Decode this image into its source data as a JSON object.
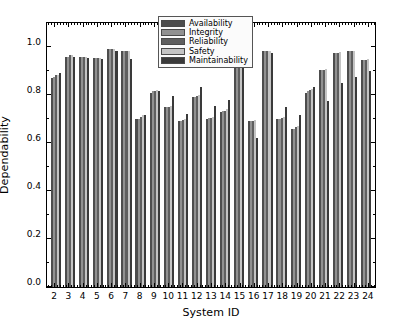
{
  "chart_data": {
    "type": "bar",
    "title": "",
    "subtitle": "",
    "xlabel": "System ID",
    "ylabel": "Dependability",
    "categories": [
      "2",
      "3",
      "4",
      "5",
      "6",
      "7",
      "8",
      "9",
      "10",
      "11",
      "12",
      "13",
      "14",
      "15",
      "16",
      "17",
      "18",
      "19",
      "20",
      "21",
      "22",
      "23",
      "24"
    ],
    "xlim": [
      1.5,
      24.5
    ],
    "ylim": [
      0.0,
      1.1
    ],
    "yticks": [
      "0.0",
      "0.2",
      "0.4",
      "0.6",
      "0.8",
      "1.0"
    ],
    "ytick_values": [
      0.0,
      0.2,
      0.4,
      0.6,
      0.8,
      1.0
    ],
    "grid": false,
    "legend_position": "upper center",
    "legend_entries": [
      "Availability",
      "Integrity",
      "Reliability",
      "Safety",
      "Maintainability"
    ],
    "series": [
      {
        "name": "Availability",
        "color": "#4d4d4d",
        "values": [
          0.87,
          0.96,
          0.96,
          0.955,
          0.99,
          0.985,
          0.7,
          0.81,
          0.75,
          0.69,
          0.79,
          0.7,
          0.73,
          0.99,
          0.69,
          0.985,
          0.7,
          0.66,
          0.81,
          0.905,
          0.975,
          0.985,
          0.945
        ]
      },
      {
        "name": "Integrity",
        "color": "#919191",
        "values": [
          0.875,
          0.96,
          0.96,
          0.955,
          0.99,
          0.985,
          0.7,
          0.815,
          0.75,
          0.69,
          0.79,
          0.705,
          0.735,
          0.99,
          0.69,
          0.985,
          0.7,
          0.66,
          0.815,
          0.905,
          0.975,
          0.985,
          0.945
        ]
      },
      {
        "name": "Reliability",
        "color": "#5f5f5f",
        "values": [
          0.885,
          0.965,
          0.96,
          0.955,
          0.99,
          0.985,
          0.71,
          0.815,
          0.75,
          0.695,
          0.795,
          0.705,
          0.735,
          0.99,
          0.69,
          0.985,
          0.705,
          0.665,
          0.82,
          0.905,
          0.975,
          0.985,
          0.945
        ]
      },
      {
        "name": "Safety",
        "color": "#c4c4c4",
        "values": [
          0.885,
          0.965,
          0.96,
          0.955,
          0.99,
          0.985,
          0.715,
          0.82,
          0.755,
          0.7,
          0.8,
          0.71,
          0.74,
          0.99,
          0.695,
          0.985,
          0.71,
          0.67,
          0.825,
          0.91,
          0.98,
          0.985,
          0.95
        ]
      },
      {
        "name": "Maintainability",
        "color": "#3a3a3a",
        "values": [
          0.89,
          0.96,
          0.955,
          0.95,
          0.985,
          0.95,
          0.715,
          0.815,
          0.795,
          0.72,
          0.835,
          0.755,
          0.78,
          0.93,
          0.62,
          0.975,
          0.75,
          0.715,
          0.835,
          0.775,
          0.85,
          0.875,
          0.9
        ]
      }
    ]
  }
}
